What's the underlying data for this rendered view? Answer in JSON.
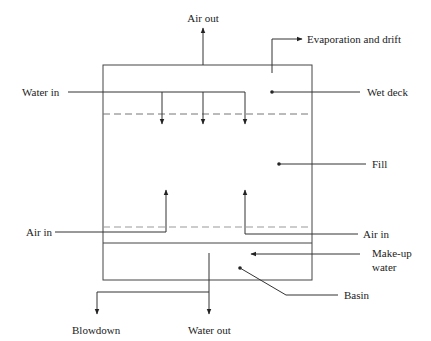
{
  "diagram": {
    "type": "cooling-tower-schematic",
    "colors": {
      "line": "#333333",
      "dashed": "#777777",
      "text": "#222222",
      "background": "#ffffff"
    },
    "labels": {
      "air_out": "Air out",
      "evaporation": "Evaporation and drift",
      "water_in": "Water in",
      "wet_deck": "Wet deck",
      "fill": "Fill",
      "air_in_left": "Air in",
      "air_in_right": "Air in",
      "makeup_line1": "Make-up",
      "makeup_line2": "water",
      "basin": "Basin",
      "blowdown": "Blowdown",
      "water_out": "Water out"
    }
  }
}
